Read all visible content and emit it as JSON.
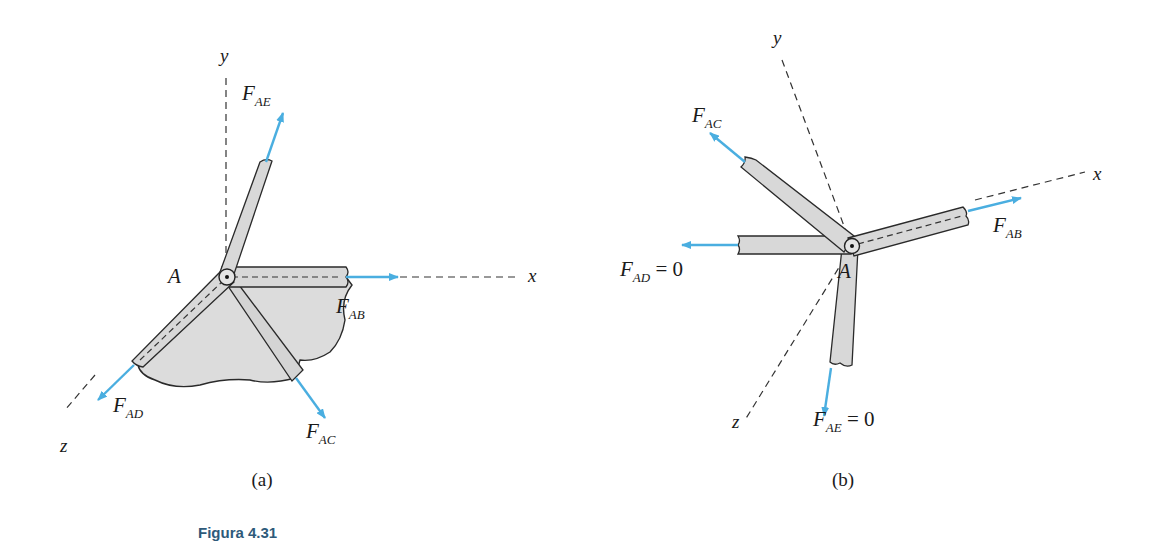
{
  "figure": {
    "caption": "Figura 4.31",
    "caption_color": "#2e5a7a",
    "force_color": "#4aaee0",
    "member_fill": "#dcdcdc"
  },
  "panel_a": {
    "label": "(a)",
    "joint": "A",
    "axes": {
      "x": "x",
      "y": "y",
      "z": "z"
    },
    "forces": {
      "ae": {
        "main": "F",
        "sub": "AE",
        "suffix": ""
      },
      "ab": {
        "main": "F",
        "sub": "AB",
        "suffix": ""
      },
      "ad": {
        "main": "F",
        "sub": "AD",
        "suffix": ""
      },
      "ac": {
        "main": "F",
        "sub": "AC",
        "suffix": ""
      }
    }
  },
  "panel_b": {
    "label": "(b)",
    "joint": "A",
    "axes": {
      "x": "x",
      "y": "y",
      "z": "z"
    },
    "forces": {
      "ac": {
        "main": "F",
        "sub": "AC",
        "suffix": ""
      },
      "ab": {
        "main": "F",
        "sub": "AB",
        "suffix": ""
      },
      "ad": {
        "main": "F",
        "sub": "AD",
        "suffix": " = 0"
      },
      "ae": {
        "main": "F",
        "sub": "AE",
        "suffix": " = 0"
      }
    }
  }
}
